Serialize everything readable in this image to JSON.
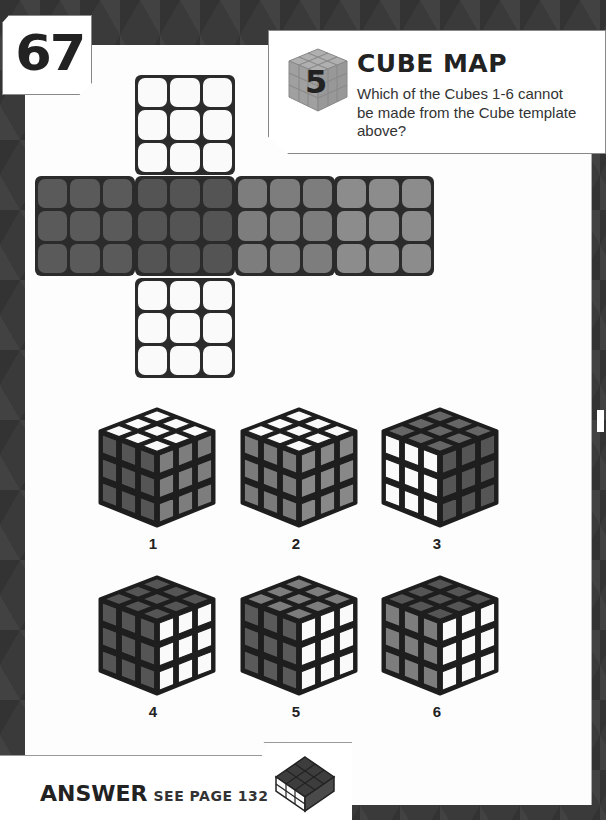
{
  "page": {
    "number": "67",
    "accent_colors": {
      "background": "#3a3a3a",
      "card": "#fdfdfd",
      "ink": "#222222"
    }
  },
  "header": {
    "difficulty_level": "5",
    "difficulty_icon": "cube-icon",
    "title": "CUBE MAP",
    "question": "Which of the Cubes 1-6 cannot be made from the Cube template above?"
  },
  "cube_net": {
    "faces": [
      {
        "position": "top",
        "shade": "white",
        "color": "#fafafa"
      },
      {
        "position": "left",
        "shade": "dark",
        "color": "#5a5a5a"
      },
      {
        "position": "center",
        "shade": "darker",
        "color": "#545454"
      },
      {
        "position": "right",
        "shade": "mid-gray",
        "color": "#7d7d7d"
      },
      {
        "position": "far-right",
        "shade": "light-gray",
        "color": "#8c8c8c"
      },
      {
        "position": "bottom",
        "shade": "white",
        "color": "#fafafa"
      }
    ]
  },
  "options": [
    {
      "label": "1",
      "top": "#fafafa",
      "left": "#555555",
      "right": "#7d7d7d"
    },
    {
      "label": "2",
      "top": "#fafafa",
      "left": "#7a7a7a",
      "right": "#888888"
    },
    {
      "label": "3",
      "top": "#666666",
      "left": "#fafafa",
      "right": "#555555"
    },
    {
      "label": "4",
      "top": "#555555",
      "left": "#555555",
      "right": "#fafafa"
    },
    {
      "label": "5",
      "top": "#7d7d7d",
      "left": "#5a5a5a",
      "right": "#fafafa"
    },
    {
      "label": "6",
      "top": "#555555",
      "left": "#7d7d7d",
      "right": "#fafafa"
    }
  ],
  "footer": {
    "answer_label": "ANSWER",
    "answer_ref": "SEE PAGE 132",
    "answer_icon": "cube-icon"
  }
}
